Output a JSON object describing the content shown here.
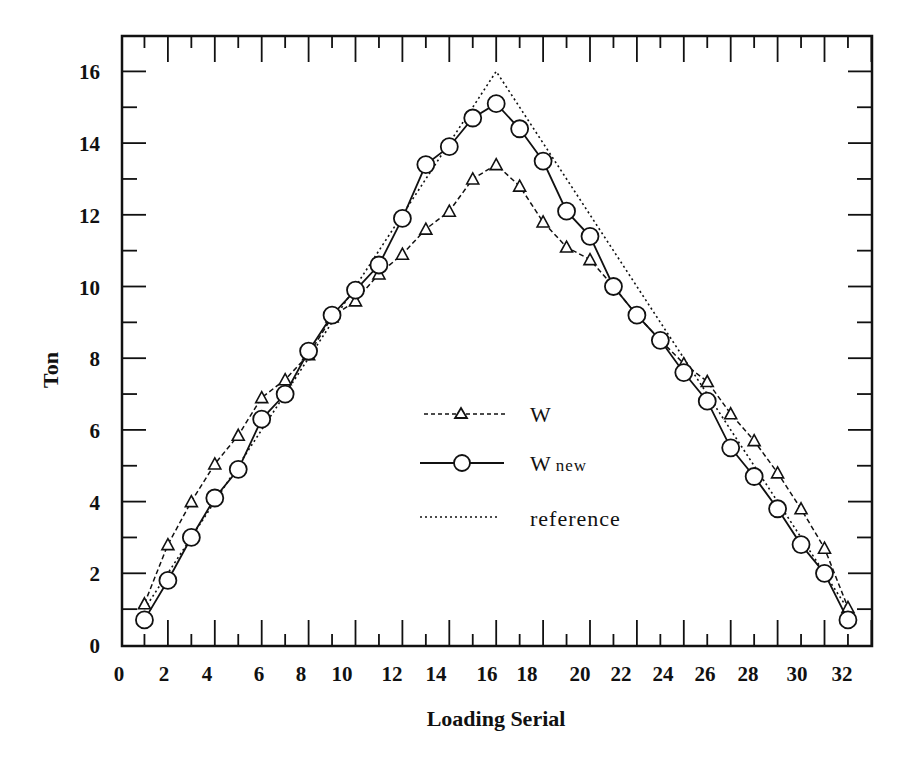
{
  "chart_data": {
    "type": "line",
    "title": "",
    "xlabel": "Loading Serial",
    "ylabel": "Ton",
    "xlim": [
      0,
      33
    ],
    "ylim": [
      0,
      17
    ],
    "x_ticks": [
      0,
      2,
      4,
      6,
      8,
      10,
      12,
      14,
      16,
      18,
      20,
      22,
      24,
      26,
      28,
      30,
      32
    ],
    "y_ticks": [
      0,
      2,
      4,
      6,
      8,
      10,
      12,
      14,
      16
    ],
    "grid": false,
    "legend_position": "center",
    "x": [
      1,
      2,
      3,
      4,
      5,
      6,
      7,
      8,
      9,
      10,
      11,
      12,
      13,
      14,
      15,
      16,
      17,
      18,
      19,
      20,
      21,
      22,
      23,
      24,
      25,
      26,
      27,
      28,
      29,
      30,
      31
    ],
    "series": [
      {
        "name": "W",
        "style": "dashed",
        "marker": "triangle",
        "values": [
          1.15,
          2.8,
          4.0,
          5.05,
          5.85,
          6.9,
          7.4,
          8.1,
          9.15,
          9.6,
          10.35,
          10.9,
          11.6,
          12.1,
          13.0,
          13.4,
          12.8,
          11.8,
          11.1,
          10.75,
          10.0,
          9.2,
          8.5,
          7.85,
          7.35,
          6.45,
          5.7,
          4.8,
          3.8,
          2.7,
          1.05
        ]
      },
      {
        "name": "W new",
        "style": "solid",
        "marker": "circle",
        "values": [
          0.7,
          1.8,
          3.0,
          4.1,
          4.9,
          6.3,
          7.0,
          8.2,
          9.2,
          9.9,
          10.6,
          11.9,
          13.4,
          13.9,
          14.7,
          15.1,
          14.4,
          13.5,
          12.1,
          11.4,
          10.0,
          9.2,
          8.5,
          7.6,
          6.8,
          5.5,
          4.7,
          3.8,
          2.8,
          2.0,
          0.7
        ]
      },
      {
        "name": "reference",
        "style": "dotted",
        "marker": "none",
        "values": [
          1,
          2,
          3,
          4,
          5,
          6,
          7,
          8,
          9,
          10,
          11,
          12,
          13,
          14,
          15,
          16,
          15,
          14,
          13,
          12,
          11,
          10,
          9,
          8,
          7,
          6,
          5,
          4,
          3,
          2,
          1
        ]
      }
    ]
  },
  "legend": {
    "items": [
      {
        "label": "W",
        "sub": ""
      },
      {
        "label": "W",
        "sub": "new"
      },
      {
        "label": "reference",
        "sub": ""
      }
    ]
  },
  "colors": {
    "ink": "#111111",
    "background": "#ffffff"
  }
}
